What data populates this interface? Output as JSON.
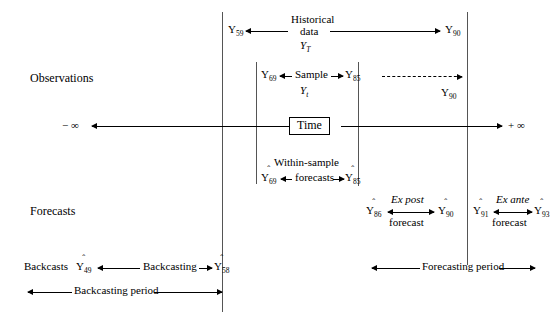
{
  "diagram": {
    "title_implicit": "Forecasting and backcasting time line",
    "row_labels": {
      "observations": "Observations",
      "forecasts": "Forecasts"
    },
    "axis": {
      "left_infinity": "− ∞",
      "right_infinity": "+ ∞",
      "axis_box_label": "Time"
    },
    "historical": {
      "left_value": "Y",
      "left_sub": "59",
      "line1": "Historical",
      "line2": "data",
      "line3_var": "Y",
      "line3_sub": "T",
      "right_value": "Y",
      "right_sub": "90"
    },
    "sample": {
      "left_value": "Y",
      "left_sub": "69",
      "label": "Sample",
      "sub_label_var": "Y",
      "sub_label_sub": "t",
      "right_value": "Y",
      "right_sub": "85",
      "dashed_end_value": "Y",
      "dashed_end_sub": "90"
    },
    "within_sample": {
      "line1": "Within-sample",
      "line2": "forecasts",
      "left_value": "Y",
      "left_sub": "69",
      "right_value": "Y",
      "right_sub": "85",
      "hat": "ˆ"
    },
    "ex_post": {
      "title": "Ex post",
      "subtitle": "forecast",
      "left_value": "Y",
      "left_sub": "86",
      "right_value": "Y",
      "right_sub": "90",
      "hat": "ˆ"
    },
    "ex_ante": {
      "title": "Ex ante",
      "subtitle": "forecast",
      "left_value": "Y",
      "left_sub": "91",
      "right_value": "Y",
      "right_sub": "93",
      "hat": "ˆ"
    },
    "backcasting": {
      "prefix": "Backcasts",
      "left_value": "Y",
      "left_sub": "49",
      "label": "Backcasting",
      "right_value": "Y",
      "right_sub": "58",
      "hat": "ˆ",
      "period_label": "Backcasting period"
    },
    "forecasting": {
      "period_label": "Forecasting period"
    },
    "colors": {
      "ink": "#000000",
      "rule": "#555555",
      "background": "#ffffff"
    }
  }
}
